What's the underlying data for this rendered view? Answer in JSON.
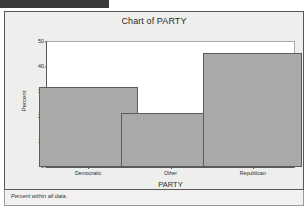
{
  "header": {
    "redaction_bar": "",
    "redaction_color": "#3b3b3b"
  },
  "panel": {
    "background_color": "#eeeeec",
    "border_color": "#55585c"
  },
  "footnote": {
    "text": "Percent within all data."
  },
  "chart_data": {
    "type": "bar",
    "title": "Chart of PARTY",
    "xlabel": "PARTY",
    "ylabel": "Percent",
    "categories": [
      "Democratic",
      "Other",
      "Republican"
    ],
    "values": [
      32,
      21.5,
      45.5
    ],
    "ylim": [
      0,
      50
    ],
    "yticks": [
      0,
      10,
      20,
      30,
      40,
      50
    ],
    "ytick_labels": [
      "0",
      "10",
      "20",
      "30",
      "40",
      "50"
    ],
    "grid": false,
    "legend": false,
    "bar_fill_color": "#a9a9a9",
    "bar_border_color": "#5c5c5c",
    "plot_background": "#ffffff"
  }
}
